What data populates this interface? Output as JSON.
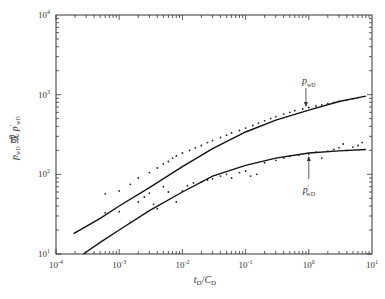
{
  "chart_data": {
    "type": "scatter",
    "title": "",
    "xlabel": "t_D/C_D",
    "ylabel": "p_wD 或 p'_wD",
    "xscale": "log",
    "yscale": "log",
    "xlim": [
      0.0001,
      10
    ],
    "ylim": [
      10,
      10000
    ],
    "grid": false,
    "x_ticks": [
      {
        "value": 0.0001,
        "base": "10",
        "exp": "-4"
      },
      {
        "value": 0.001,
        "base": "10",
        "exp": "-3"
      },
      {
        "value": 0.01,
        "base": "10",
        "exp": "-2"
      },
      {
        "value": 0.1,
        "base": "10",
        "exp": "-1"
      },
      {
        "value": 1,
        "base": "10",
        "exp": "0"
      },
      {
        "value": 10,
        "base": "10",
        "exp": "1"
      }
    ],
    "y_ticks": [
      {
        "value": 10,
        "base": "10",
        "exp": "1"
      },
      {
        "value": 100,
        "base": "10",
        "exp": "2"
      },
      {
        "value": 1000,
        "base": "10",
        "exp": "3"
      },
      {
        "value": 10000,
        "base": "10",
        "exp": "4"
      }
    ],
    "series": [
      {
        "name": "p_wD model",
        "kind": "line",
        "x": [
          0.00019,
          0.0005,
          0.001,
          0.003,
          0.01,
          0.03,
          0.1,
          0.3,
          1,
          3,
          8
        ],
        "y": [
          18,
          28,
          40,
          68,
          125,
          210,
          340,
          480,
          640,
          820,
          960
        ]
      },
      {
        "name": "p'_wD model",
        "kind": "line",
        "x": [
          0.00027,
          0.0005,
          0.001,
          0.003,
          0.01,
          0.03,
          0.1,
          0.3,
          1,
          3,
          8
        ],
        "y": [
          10,
          14,
          20,
          35,
          60,
          95,
          130,
          160,
          185,
          197,
          205
        ]
      },
      {
        "name": "p_wD measured",
        "kind": "scatter",
        "x": [
          0.0006,
          0.001,
          0.0015,
          0.002,
          0.003,
          0.004,
          0.005,
          0.006,
          0.007,
          0.008,
          0.01,
          0.013,
          0.016,
          0.02,
          0.025,
          0.03,
          0.04,
          0.05,
          0.06,
          0.08,
          0.1,
          0.13,
          0.16,
          0.2,
          0.25,
          0.3,
          0.4,
          0.5,
          0.6,
          0.8,
          1,
          1.3,
          1.6,
          2,
          2.5,
          3,
          4,
          5,
          6
        ],
        "y": [
          33,
          62,
          75,
          90,
          105,
          120,
          135,
          145,
          160,
          170,
          185,
          200,
          215,
          230,
          250,
          265,
          290,
          310,
          330,
          355,
          380,
          410,
          440,
          470,
          500,
          530,
          570,
          600,
          630,
          660,
          690,
          720,
          745,
          770,
          800,
          820,
          860,
          890,
          920
        ]
      },
      {
        "name": "p'_wD measured",
        "kind": "scatter",
        "x": [
          0.0006,
          0.001,
          0.0015,
          0.002,
          0.0025,
          0.003,
          0.0035,
          0.004,
          0.005,
          0.006,
          0.008,
          0.01,
          0.012,
          0.015,
          0.02,
          0.025,
          0.03,
          0.04,
          0.05,
          0.06,
          0.08,
          0.1,
          0.12,
          0.15,
          0.2,
          0.3,
          0.4,
          0.5,
          0.7,
          1,
          1.3,
          1.6,
          2,
          2.5,
          3,
          3.5,
          4,
          5,
          6,
          7
        ],
        "y": [
          57,
          34,
          25,
          45,
          52,
          58,
          42,
          37,
          70,
          60,
          45,
          62,
          72,
          78,
          80,
          85,
          88,
          95,
          100,
          90,
          105,
          110,
          95,
          100,
          140,
          150,
          160,
          170,
          175,
          180,
          190,
          160,
          195,
          205,
          215,
          240,
          200,
          220,
          230,
          250
        ]
      }
    ],
    "annotations": [
      {
        "text_main": "p",
        "text_sub": "wD",
        "prime": false,
        "points_to": {
          "x": 0.9,
          "y": 640
        },
        "arrow": "down"
      },
      {
        "text_main": "p",
        "text_sub": "wD",
        "prime": true,
        "points_to": {
          "x": 1.0,
          "y": 185
        },
        "arrow": "up"
      }
    ]
  }
}
